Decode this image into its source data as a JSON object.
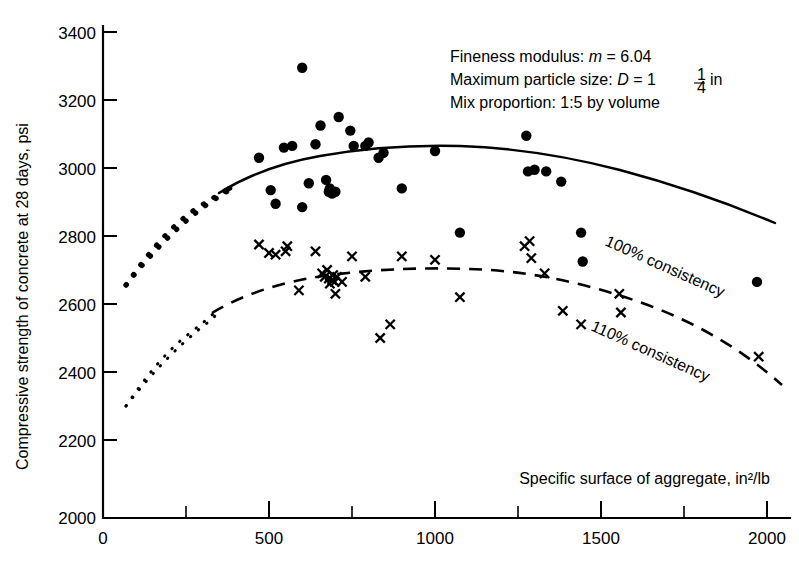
{
  "chart_data": {
    "type": "scatter",
    "title": "",
    "xlabel": "Specific surface of aggregate, in²/lb",
    "ylabel": "Compressive strength of concrete at 28 days, psi",
    "xlim": [
      0,
      2050
    ],
    "ylim": [
      2000,
      3400
    ],
    "grid": false,
    "legend_position": "inline-curve-labels",
    "x_ticks": [
      0,
      500,
      1000,
      1500,
      2000
    ],
    "x_tick_labels": [
      "0",
      "500",
      "1000",
      "1500",
      "2000"
    ],
    "x_minor_ticks": [
      250,
      750,
      1250,
      1750
    ],
    "y_ticks": [
      2000,
      2200,
      2400,
      2600,
      2800,
      3000,
      3200,
      3400
    ],
    "y_tick_labels": [
      "2000",
      "2200",
      "2400",
      "2600",
      "2800",
      "3000",
      "3200",
      "3400"
    ],
    "annotations": [
      "Fineness modulus: m = 6.04",
      "Maximum particle size: D = 1 1/4 in",
      "Mix proportion: 1:5 by volume"
    ],
    "series": [
      {
        "name": "100% consistency",
        "marker": "filled-circle",
        "curve_style": "solid",
        "label": "100% consistency",
        "points": [
          [
            470,
            3030
          ],
          [
            505,
            2935
          ],
          [
            520,
            2895
          ],
          [
            545,
            3060
          ],
          [
            570,
            3065
          ],
          [
            600,
            3295
          ],
          [
            600,
            2885
          ],
          [
            620,
            2955
          ],
          [
            640,
            3070
          ],
          [
            655,
            3125
          ],
          [
            672,
            2965
          ],
          [
            680,
            2930
          ],
          [
            683,
            2940
          ],
          [
            690,
            2925
          ],
          [
            700,
            2930
          ],
          [
            710,
            3150
          ],
          [
            745,
            3110
          ],
          [
            755,
            3065
          ],
          [
            790,
            3065
          ],
          [
            800,
            3075
          ],
          [
            830,
            3030
          ],
          [
            845,
            3045
          ],
          [
            900,
            2940
          ],
          [
            1000,
            3050
          ],
          [
            1075,
            2810
          ],
          [
            1275,
            3095
          ],
          [
            1280,
            2990
          ],
          [
            1300,
            2995
          ],
          [
            1335,
            2990
          ],
          [
            1380,
            2960
          ],
          [
            1440,
            2810
          ],
          [
            1445,
            2725
          ],
          [
            1970,
            2665
          ]
        ]
      },
      {
        "name": "110% consistency",
        "marker": "cross",
        "curve_style": "dashed",
        "label": "110% consistency",
        "points": [
          [
            470,
            2775
          ],
          [
            500,
            2750
          ],
          [
            520,
            2745
          ],
          [
            550,
            2755
          ],
          [
            555,
            2770
          ],
          [
            590,
            2640
          ],
          [
            640,
            2755
          ],
          [
            660,
            2690
          ],
          [
            668,
            2680
          ],
          [
            675,
            2700
          ],
          [
            680,
            2675
          ],
          [
            683,
            2660
          ],
          [
            690,
            2670
          ],
          [
            693,
            2685
          ],
          [
            698,
            2665
          ],
          [
            700,
            2630
          ],
          [
            705,
            2680
          ],
          [
            720,
            2665
          ],
          [
            750,
            2740
          ],
          [
            790,
            2680
          ],
          [
            835,
            2500
          ],
          [
            865,
            2540
          ],
          [
            900,
            2740
          ],
          [
            1000,
            2730
          ],
          [
            1075,
            2620
          ],
          [
            1270,
            2770
          ],
          [
            1285,
            2785
          ],
          [
            1290,
            2735
          ],
          [
            1330,
            2690
          ],
          [
            1385,
            2580
          ],
          [
            1440,
            2540
          ],
          [
            1555,
            2630
          ],
          [
            1560,
            2575
          ],
          [
            1975,
            2445
          ]
        ]
      }
    ],
    "fitted_curves": [
      {
        "name": "100% consistency",
        "style": "solid",
        "extension_style": "dotted-coarse",
        "extension_range": [
          70,
          350
        ],
        "solid_range": [
          350,
          1960
        ],
        "points": [
          [
            70,
            2655
          ],
          [
            150,
            2790
          ],
          [
            250,
            2900
          ],
          [
            350,
            2955
          ],
          [
            500,
            3020
          ],
          [
            650,
            3060
          ],
          [
            760,
            3068
          ],
          [
            900,
            3055
          ],
          [
            1100,
            3000
          ],
          [
            1300,
            2920
          ],
          [
            1500,
            2820
          ],
          [
            1700,
            2720
          ],
          [
            1960,
            2620
          ]
        ]
      },
      {
        "name": "110% consistency",
        "style": "dashed",
        "extension_style": "dotted-fine",
        "extension_range": [
          70,
          330
        ],
        "dashed_range": [
          330,
          1990
        ],
        "points": [
          [
            70,
            2325
          ],
          [
            150,
            2500
          ],
          [
            250,
            2615
          ],
          [
            330,
            2665
          ],
          [
            500,
            2710
          ],
          [
            650,
            2735
          ],
          [
            800,
            2745
          ],
          [
            950,
            2740
          ],
          [
            1100,
            2720
          ],
          [
            1300,
            2680
          ],
          [
            1500,
            2615
          ],
          [
            1700,
            2535
          ],
          [
            1990,
            2390
          ]
        ]
      }
    ]
  },
  "axes": {
    "y_title": "Compressive strength of concrete at 28 days, psi",
    "x_title": "Specific surface of aggregate, in²/lb",
    "y_labels": [
      "3400",
      "3200",
      "3000",
      "2800",
      "2600",
      "2400",
      "2200",
      "2000"
    ],
    "x_labels": [
      "0",
      "500",
      "1000",
      "1500",
      "2000"
    ]
  },
  "annotation_block": {
    "line1_prefix": "Fineness modulus: ",
    "line1_var": "m",
    "line1_value": " = 6.04",
    "line2_prefix": "Maximum particle size: ",
    "line2_var": "D",
    "line2_value": " = 1",
    "line2_frac_num": "1",
    "line2_frac_den": "4",
    "line2_unit": "in",
    "line3": "Mix proportion: 1:5 by volume"
  },
  "curve_labels": {
    "upper": "100% consistency",
    "lower": "110% consistency"
  }
}
